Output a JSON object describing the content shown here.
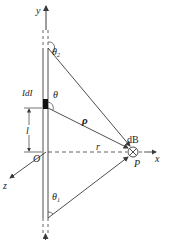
{
  "diagram": {
    "title": "",
    "type": "biot-savart-finite-wire",
    "colors": {
      "line": "#3a3a3a",
      "text": "#222222",
      "element": "#111111",
      "background": "#ffffff"
    },
    "labels": {
      "y_axis": "y",
      "x_axis": "x",
      "z_axis": "z",
      "origin": "O",
      "current_element": "IdI",
      "length": "l",
      "distance_r": "r",
      "vector_rho": "ρ",
      "angle_theta": "θ",
      "angle_theta1": "θ",
      "angle_theta1_sub": "1",
      "angle_theta2": "θ",
      "angle_theta2_sub": "2",
      "field_element": "dB",
      "point_p": "P",
      "current_dir": "I"
    },
    "symbols": {
      "into_page": "⊗"
    }
  }
}
